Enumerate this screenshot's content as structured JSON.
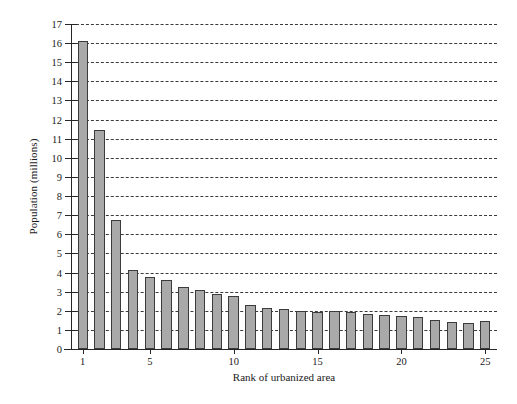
{
  "chart_data": {
    "type": "bar",
    "title": "",
    "xlabel": "Rank of urbanized area",
    "ylabel": "Population (millions)",
    "categories": [
      1,
      2,
      3,
      4,
      5,
      6,
      7,
      8,
      9,
      10,
      11,
      12,
      13,
      14,
      15,
      16,
      17,
      18,
      19,
      20,
      21,
      22,
      23,
      24,
      25
    ],
    "values": [
      16.1,
      11.45,
      6.75,
      4.15,
      3.75,
      3.6,
      3.25,
      3.1,
      2.9,
      2.75,
      2.3,
      2.15,
      2.1,
      2.0,
      1.95,
      2.0,
      1.95,
      1.85,
      1.8,
      1.75,
      1.7,
      1.5,
      1.4,
      1.35,
      1.45
    ],
    "ylim": [
      0,
      17
    ],
    "xlim": [
      0.3,
      25.7
    ],
    "ytick_labels": [
      "0",
      "1",
      "2",
      "3",
      "4",
      "5",
      "6",
      "7",
      "8",
      "9",
      "10",
      "11",
      "12",
      "13",
      "14",
      "15",
      "16",
      "17"
    ],
    "ytick_values": [
      0,
      1,
      2,
      3,
      4,
      5,
      6,
      7,
      8,
      9,
      10,
      11,
      12,
      13,
      14,
      15,
      16,
      17
    ],
    "xtick_labels": [
      "1",
      "5",
      "10",
      "15",
      "20",
      "25"
    ],
    "xtick_values": [
      1,
      5,
      10,
      15,
      20,
      25
    ],
    "grid": "horizontal-dashed",
    "legend": "none",
    "bar_color": "#a9a9a9",
    "bar_edge_color": "#3b3b3b",
    "axis_color": "#262626",
    "background_color": "#ffffff"
  }
}
